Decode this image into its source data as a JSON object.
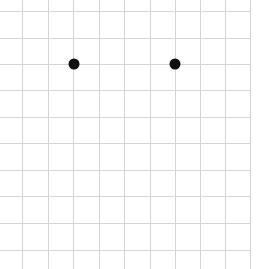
{
  "diagram": {
    "type": "dot-grid",
    "background": "#ffffff",
    "grid": {
      "color": "#d4d4d4",
      "line_width": 1,
      "vertical_lines_x": [
        22,
        48,
        73,
        99,
        124,
        150,
        175,
        200,
        225,
        250
      ],
      "horizontal_lines_y": [
        11,
        38,
        64,
        90,
        117,
        143,
        170,
        196,
        223,
        250
      ],
      "extent": {
        "x0": 0,
        "y0": 0,
        "x1": 251,
        "y1": 269
      }
    },
    "dots": [
      {
        "x": 74,
        "y": 64,
        "r": 5.5,
        "color": "#111111"
      },
      {
        "x": 175,
        "y": 64,
        "r": 5.5,
        "color": "#111111"
      }
    ]
  }
}
